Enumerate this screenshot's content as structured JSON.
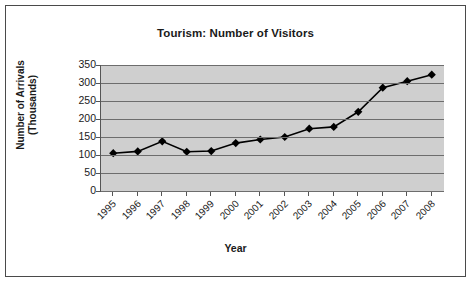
{
  "chart_data": {
    "type": "line",
    "title": "Tourism: Number of Visitors",
    "xlabel": "Year",
    "ylabel": "Number of Arrivals (Thousands)",
    "ylabel_line1": "Number of Arrivals",
    "ylabel_line2": "(Thousands)",
    "categories": [
      "1995",
      "1996",
      "1997",
      "1998",
      "1999",
      "2000",
      "2001",
      "2002",
      "2003",
      "2004",
      "2005",
      "2006",
      "2007",
      "2008"
    ],
    "values": [
      105,
      110,
      138,
      109,
      111,
      133,
      143,
      150,
      173,
      178,
      220,
      287,
      305,
      323
    ],
    "ylim": [
      0,
      350
    ],
    "yticks": [
      0,
      50,
      100,
      150,
      200,
      250,
      300,
      350
    ],
    "ytick_labels": [
      "0",
      "50",
      "100",
      "150",
      "200",
      "250",
      "300",
      "350"
    ],
    "grid": true,
    "legend": false,
    "marker": "diamond",
    "series_color": "#000000",
    "plot_background": "#cfcfcf",
    "gridline_color": "#6d6d6d"
  }
}
